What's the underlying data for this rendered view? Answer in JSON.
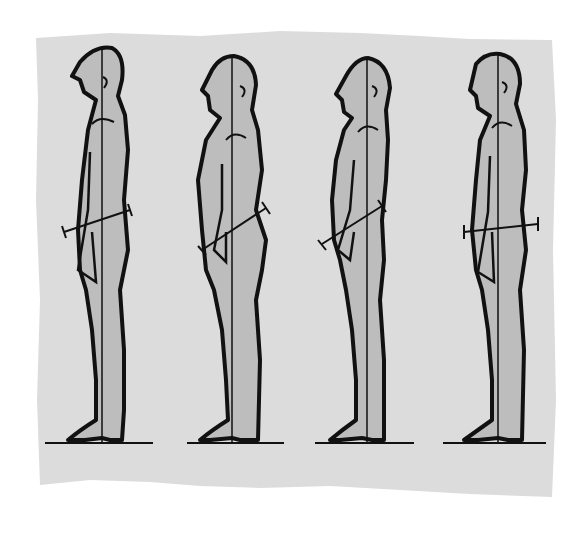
{
  "illustration": {
    "subject": "posture comparison",
    "figure_count": 4,
    "colors": {
      "page": "#ffffff",
      "paper": "#dcdcdc",
      "body_fill": "#bdbdbd",
      "outline": "#111111"
    },
    "figures": [
      {
        "index": 1,
        "plumb_x": 102,
        "pelvis_tilt": "slight"
      },
      {
        "index": 2,
        "plumb_x": 230,
        "pelvis_tilt": "anterior"
      },
      {
        "index": 3,
        "plumb_x": 367,
        "pelvis_tilt": "posterior"
      },
      {
        "index": 4,
        "plumb_x": 498,
        "pelvis_tilt": "neutral"
      }
    ]
  }
}
